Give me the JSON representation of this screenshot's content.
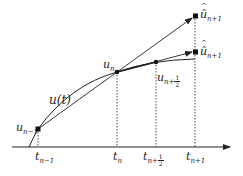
{
  "diagram": {
    "title": "",
    "axis": {
      "arrow": true
    },
    "curve_label": "u(t)",
    "points": [
      {
        "id": "u_n_minus_1",
        "base": "u",
        "sub": "n−1"
      },
      {
        "id": "u_n",
        "base": "u",
        "sub": "n"
      },
      {
        "id": "u_n_half",
        "base": "u",
        "sub": "n+",
        "frac": {
          "num": "1",
          "den": "2"
        }
      },
      {
        "id": "u_hat_top",
        "base": "û",
        "sub": "n+1"
      },
      {
        "id": "u_hat_bottom",
        "base": "û",
        "sub": "n+1"
      }
    ],
    "ticks": [
      {
        "id": "t_n_minus_1",
        "base": "t",
        "sub": "n−1"
      },
      {
        "id": "t_n",
        "base": "t",
        "sub": "n"
      },
      {
        "id": "t_n_half",
        "base": "t",
        "sub": "n+",
        "frac": {
          "num": "1",
          "den": "2"
        }
      },
      {
        "id": "t_n_plus_1",
        "base": "t",
        "sub": "n+1"
      }
    ],
    "colors": {
      "stroke": "#222222",
      "background": "#ffffff"
    }
  }
}
